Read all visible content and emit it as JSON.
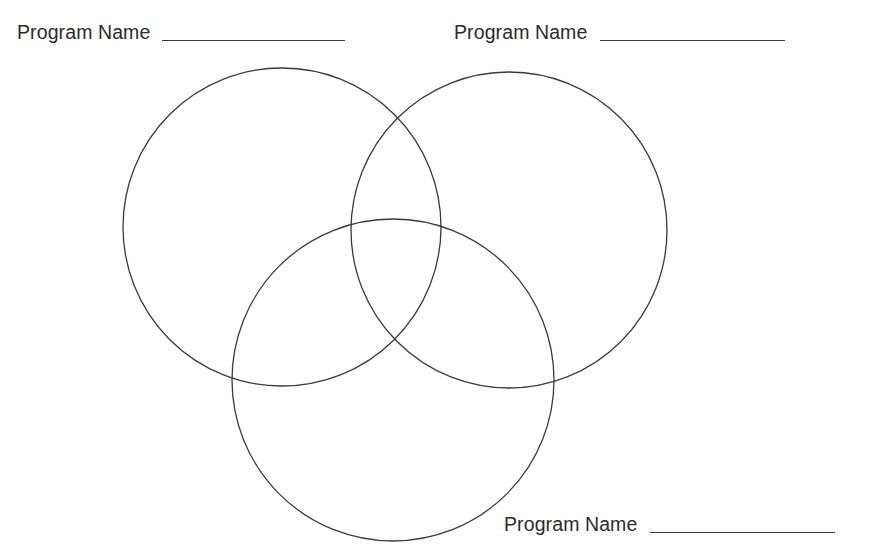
{
  "page": {
    "width": 891,
    "height": 553,
    "background_color": "#ffffff"
  },
  "style": {
    "circle_stroke_color": "#3a3a3a",
    "circle_stroke_width": 1.3,
    "circle_fill": "none",
    "text_color": "#2b2b2b",
    "blank_line_color": "#3b3b3b"
  },
  "labels": [
    {
      "id": "label-top-left",
      "text": "Program Name",
      "blank_value": "",
      "position": "top-left"
    },
    {
      "id": "label-top-right",
      "text": "Program Name",
      "blank_value": "",
      "position": "top-right"
    },
    {
      "id": "label-bottom-right",
      "text": "Program Name",
      "blank_value": "",
      "position": "bottom-right"
    }
  ],
  "diagram": {
    "type": "venn-3-circle",
    "circles": [
      {
        "id": "circle-left",
        "name": "left-circle",
        "cx": 282,
        "cy": 227,
        "r": 159
      },
      {
        "id": "circle-right",
        "name": "right-circle",
        "cx": 509,
        "cy": 230,
        "r": 158
      },
      {
        "id": "circle-bottom",
        "name": "bottom-circle",
        "cx": 393,
        "cy": 380,
        "r": 161
      }
    ]
  }
}
